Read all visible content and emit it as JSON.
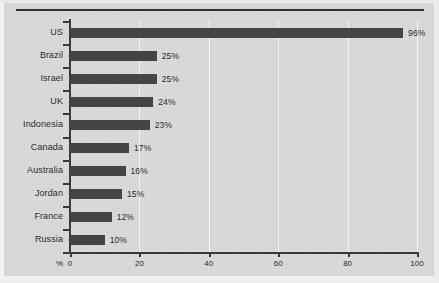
{
  "chart_data": {
    "type": "bar",
    "orientation": "horizontal",
    "title": "",
    "xlabel": "%",
    "ylabel": "",
    "categories": [
      "US",
      "Brazil",
      "Israel",
      "UK",
      "Indonesia",
      "Canada",
      "Australia",
      "Jordan",
      "France",
      "Russia"
    ],
    "values": [
      96,
      25,
      25,
      24,
      23,
      17,
      16,
      15,
      12,
      10
    ],
    "value_labels": [
      "96%",
      "25%",
      "25%",
      "24%",
      "23%",
      "17%",
      "16%",
      "15%",
      "12%",
      "10%"
    ],
    "xlim": [
      0,
      100
    ],
    "xticks": [
      0,
      20,
      40,
      60,
      80,
      100
    ],
    "xtick_labels": [
      "0",
      "20",
      "40",
      "60",
      "80",
      "100"
    ],
    "axis_unit_prefix": "%",
    "grid": true,
    "grid_axis": "x",
    "legend": null,
    "colors": {
      "bar": "#454545",
      "background": "#d9d9d7",
      "gridline": "#f4f4f2",
      "axis": "#3a3a3a",
      "text": "#2b2b2b",
      "top_rule": "#2f2f2f"
    }
  }
}
